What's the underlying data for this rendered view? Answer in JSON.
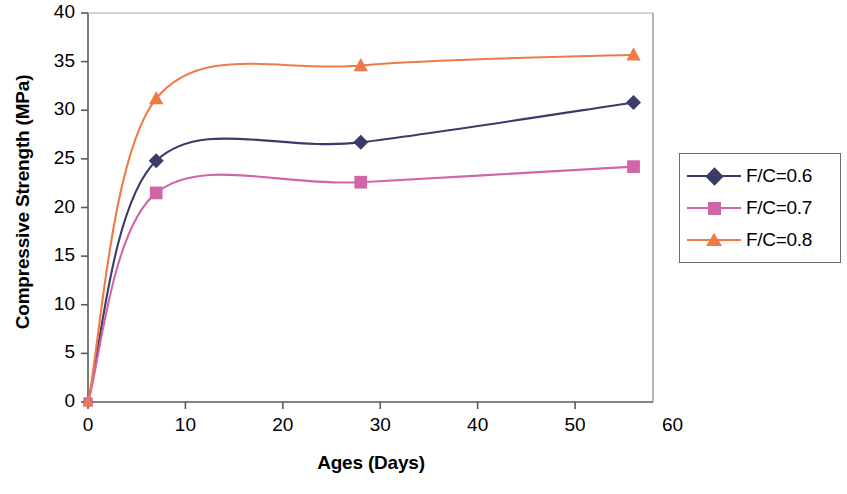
{
  "chart_data": {
    "type": "line",
    "title": "",
    "xlabel": "Ages (Days)",
    "ylabel": "Compressive Strength (MPa)",
    "xlim": [
      0,
      60
    ],
    "ylim": [
      0,
      40
    ],
    "xticks": [
      "0",
      "10",
      "20",
      "30",
      "40",
      "50",
      "60"
    ],
    "xtick_values": [
      0,
      10,
      20,
      30,
      40,
      50,
      60
    ],
    "yticks": [
      "0",
      "5",
      "10",
      "15",
      "20",
      "25",
      "30",
      "35",
      "40"
    ],
    "ytick_values": [
      0,
      5,
      10,
      15,
      20,
      25,
      30,
      35,
      40
    ],
    "x": [
      0,
      7,
      28,
      56
    ],
    "grid": false,
    "legend_position": "right",
    "smoothing": "spline",
    "series": [
      {
        "name": "F/C=0.6",
        "values": [
          0,
          24.8,
          26.7,
          30.8
        ],
        "color": "#3b3b69",
        "marker": "diamond"
      },
      {
        "name": "F/C=0.7",
        "values": [
          0,
          21.5,
          22.6,
          24.2
        ],
        "color": "#d066a8",
        "marker": "square"
      },
      {
        "name": "F/C=0.8",
        "values": [
          0,
          31.2,
          34.6,
          35.7
        ],
        "color": "#f07a45",
        "marker": "triangle"
      }
    ]
  },
  "axes": {
    "y_title": "Compressive Strength (MPa)",
    "x_title": "Ages (Days)"
  },
  "legend": {
    "entries": [
      {
        "label": "F/C=0.6"
      },
      {
        "label": "F/C=0.7"
      },
      {
        "label": "F/C=0.8"
      }
    ]
  },
  "colors": {
    "series_1": "#3b3b69",
    "series_2": "#d066a8",
    "series_3": "#f07a45",
    "axis": "#5a5a5a",
    "frame": "#8a8a8a",
    "text": "#000000"
  }
}
